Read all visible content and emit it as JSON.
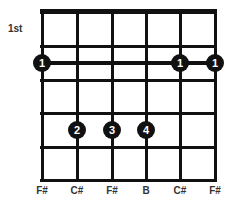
{
  "chord": {
    "fret_label": "1st",
    "strings_x": [
      42,
      77,
      112,
      146,
      180,
      215
    ],
    "frets_y": [
      46,
      80,
      113,
      147,
      180
    ],
    "barre": {
      "finger": "1",
      "y": 63
    },
    "fingers": [
      {
        "label": "1",
        "string": 0,
        "y": 63
      },
      {
        "label": "1",
        "string": 4,
        "y": 63
      },
      {
        "label": "1",
        "string": 5,
        "y": 63
      },
      {
        "label": "2",
        "string": 1,
        "y": 130
      },
      {
        "label": "3",
        "string": 2,
        "y": 130
      },
      {
        "label": "4",
        "string": 3,
        "y": 130
      }
    ],
    "notes": [
      "F#",
      "C#",
      "F#",
      "B",
      "C#",
      "F#"
    ]
  }
}
